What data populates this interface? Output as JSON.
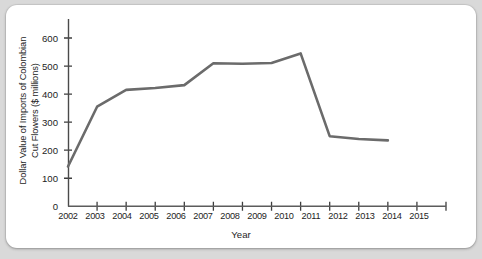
{
  "chart_data": {
    "type": "line",
    "title": "",
    "xlabel": "Year",
    "ylabel": "Dollar Value of Imports of Colombian Cut Flowers ($ millions)",
    "ylabel_line1": "Dollar Value of Imports of Colombian",
    "ylabel_line2": "Cut Flowers ($ millions)",
    "x": [
      2002,
      2003,
      2004,
      2005,
      2006,
      2007,
      2008,
      2009,
      2010,
      2011,
      2012,
      2013
    ],
    "values": [
      142,
      355,
      415,
      422,
      432,
      510,
      508,
      511,
      545,
      250,
      240,
      235
    ],
    "categories": [
      "2002",
      "2003",
      "2004",
      "2005",
      "2006",
      "2007",
      "2008",
      "2009",
      "2010",
      "2011",
      "2012",
      "2013"
    ],
    "xtick_labels": [
      "2002",
      "2003",
      "2004",
      "2005",
      "2006",
      "2007",
      "2008",
      "2009",
      "2010",
      "2011",
      "2012",
      "2013",
      "2014",
      "2015"
    ],
    "ytick_labels": [
      "0",
      "100",
      "200",
      "300",
      "400",
      "500",
      "600"
    ],
    "ytick_values": [
      0,
      100,
      200,
      300,
      400,
      500,
      600
    ],
    "xlim": [
      2002,
      2015
    ],
    "ylim": [
      0,
      650
    ],
    "grid": true,
    "grid_style": "dotted-horizontal",
    "legend": "none",
    "series_color": "#6b6b6b",
    "axis_color": "#4a4a4a",
    "background_color": "#ffffff"
  }
}
